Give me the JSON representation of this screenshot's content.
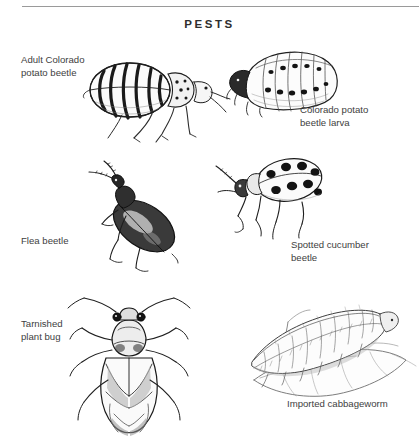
{
  "page": {
    "title": "PESTS",
    "background_color": "#ffffff",
    "rule_color": "#9a9a9a",
    "text_color": "#3e3e3e",
    "title_color": "#2e2e2e"
  },
  "figures": [
    {
      "id": "adult-colorado-potato-beetle",
      "caption": "Adult Colorado\npotato beetle",
      "illustration": "striped-beetle-illustration",
      "caption_position": "left"
    },
    {
      "id": "colorado-potato-beetle-larva",
      "caption": "Colorado potato\nbeetle larva",
      "illustration": "spotted-grub-larva-illustration",
      "caption_position": "right"
    },
    {
      "id": "flea-beetle",
      "caption": "Flea beetle",
      "illustration": "dark-flea-beetle-illustration",
      "caption_position": "left"
    },
    {
      "id": "spotted-cucumber-beetle",
      "caption": "Spotted cucumber\nbeetle",
      "illustration": "spotted-cucumber-beetle-illustration",
      "caption_position": "right"
    },
    {
      "id": "tarnished-plant-bug",
      "caption": "Tarnished\nplant bug",
      "illustration": "dorsal-plant-bug-illustration",
      "caption_position": "left"
    },
    {
      "id": "imported-cabbageworm",
      "caption": "Imported cabbageworm",
      "illustration": "caterpillar-on-leaf-illustration",
      "caption_position": "right"
    }
  ]
}
